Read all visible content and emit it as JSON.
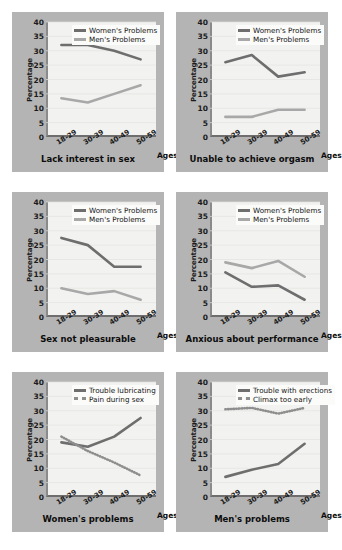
{
  "layout": {
    "panel_bg": "#b4b4b4",
    "plot_bg": "#f2f2f0",
    "page_bg": "#ffffff",
    "series_dark": "#6e6e6e",
    "series_light": "#a8a8a8",
    "axis_color": "#6e6e6e"
  },
  "common": {
    "ylabel": "Percentage",
    "xlabel": "Ages",
    "categories": [
      "18-29",
      "30-39",
      "40-49",
      "50-59"
    ],
    "yticks": [
      "0",
      "5",
      "10",
      "15",
      "20",
      "25",
      "30",
      "35",
      "40"
    ],
    "ylim": [
      0,
      40
    ]
  },
  "chart_data": [
    {
      "type": "line",
      "title": "Lack interest in sex",
      "xlabel": "Ages",
      "ylabel": "Percentage",
      "ylim": [
        0,
        40
      ],
      "grid": true,
      "legend_position": "top-center",
      "categories": [
        "18-29",
        "30-39",
        "40-49",
        "50-59"
      ],
      "series": [
        {
          "name": "Women's Problems",
          "values": [
            32,
            32,
            30,
            27
          ],
          "color": "#6e6e6e",
          "style": "solid"
        },
        {
          "name": "Men's Problems",
          "values": [
            13.5,
            12,
            15,
            18
          ],
          "color": "#a8a8a8",
          "style": "solid"
        }
      ]
    },
    {
      "type": "line",
      "title": "Unable to achieve orgasm",
      "xlabel": "Ages",
      "ylabel": "Percentage",
      "ylim": [
        0,
        40
      ],
      "grid": true,
      "legend_position": "top-center",
      "categories": [
        "18-29",
        "30-39",
        "40-49",
        "50-59"
      ],
      "series": [
        {
          "name": "Women's Problems",
          "values": [
            26,
            28.5,
            21,
            22.5
          ],
          "color": "#6e6e6e",
          "style": "solid"
        },
        {
          "name": "Men's Problems",
          "values": [
            7,
            7,
            9.5,
            9.5
          ],
          "color": "#a8a8a8",
          "style": "solid"
        }
      ]
    },
    {
      "type": "line",
      "title": "Sex not pleasurable",
      "xlabel": "Ages",
      "ylabel": "Percentage",
      "ylim": [
        0,
        40
      ],
      "grid": true,
      "legend_position": "top-center",
      "categories": [
        "18-29",
        "30-39",
        "40-49",
        "50-59"
      ],
      "series": [
        {
          "name": "Women's Problems",
          "values": [
            27.5,
            25,
            17.5,
            17.5
          ],
          "color": "#6e6e6e",
          "style": "solid"
        },
        {
          "name": "Men's Problems",
          "values": [
            10,
            8,
            9,
            6
          ],
          "color": "#a8a8a8",
          "style": "solid"
        }
      ]
    },
    {
      "type": "line",
      "title": "Anxious about performance",
      "xlabel": "Ages",
      "ylabel": "Percentage",
      "ylim": [
        0,
        40
      ],
      "grid": true,
      "legend_position": "top-center",
      "categories": [
        "18-29",
        "30-39",
        "40-49",
        "50-59"
      ],
      "series": [
        {
          "name": "Women's Problems",
          "values": [
            15.5,
            10.5,
            11,
            6
          ],
          "color": "#6e6e6e",
          "style": "solid"
        },
        {
          "name": "Men's Problems",
          "values": [
            19,
            17,
            19.5,
            14
          ],
          "color": "#a8a8a8",
          "style": "solid"
        }
      ]
    },
    {
      "type": "line",
      "title": "Women's problems",
      "xlabel": "Ages",
      "ylabel": "Percentage",
      "ylim": [
        0,
        40
      ],
      "grid": true,
      "legend_position": "top-center",
      "categories": [
        "18-29",
        "30-39",
        "40-49",
        "50-59"
      ],
      "series": [
        {
          "name": "Trouble lubricating",
          "values": [
            19,
            17.5,
            21,
            27.5
          ],
          "color": "#6e6e6e",
          "style": "solid"
        },
        {
          "name": "Pain during sex",
          "values": [
            21,
            16,
            12,
            7.5
          ],
          "color": "#8e8e8e",
          "style": "dotted"
        }
      ]
    },
    {
      "type": "line",
      "title": "Men's problems",
      "xlabel": "Ages",
      "ylabel": "Percentage",
      "ylim": [
        0,
        40
      ],
      "grid": true,
      "legend_position": "top-center",
      "categories": [
        "18-29",
        "30-39",
        "40-49",
        "50-59"
      ],
      "series": [
        {
          "name": "Trouble with erections",
          "values": [
            7,
            9.5,
            11.5,
            18.5
          ],
          "color": "#6e6e6e",
          "style": "solid"
        },
        {
          "name": "Climax too early",
          "values": [
            30.5,
            31,
            29,
            31
          ],
          "color": "#8e8e8e",
          "style": "dotted"
        }
      ]
    }
  ]
}
